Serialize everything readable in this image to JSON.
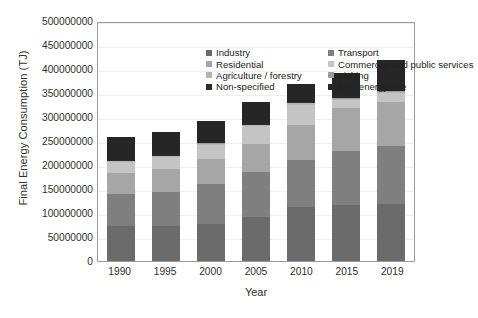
{
  "chart_data": {
    "type": "bar",
    "stacked": true,
    "title": "",
    "xlabel": "Year",
    "ylabel": "Final Energy Consumption (TJ)",
    "categories": [
      "1990",
      "1995",
      "2000",
      "2005",
      "2010",
      "2015",
      "2019"
    ],
    "ylim": [
      0,
      500000000
    ],
    "ytick_values": [
      0,
      50000000,
      100000000,
      150000000,
      200000000,
      250000000,
      300000000,
      350000000,
      400000000,
      450000000,
      500000000
    ],
    "ytick_labels": [
      "0",
      "50000000",
      "100000000",
      "150000000",
      "200000000",
      "250000000",
      "300000000",
      "350000000",
      "400000000",
      "450000000",
      "500000000"
    ],
    "grid": true,
    "legend_position": "upper-left-inside",
    "legend_columns": 2,
    "series": [
      {
        "name": "Industry",
        "color": "#6b6b6b",
        "values": [
          72000000,
          73000000,
          78000000,
          92000000,
          112000000,
          116000000,
          118000000
        ]
      },
      {
        "name": "Transport",
        "color": "#7f7f7f",
        "values": [
          67000000,
          71000000,
          82000000,
          93000000,
          99000000,
          114000000,
          122000000
        ]
      },
      {
        "name": "Residential",
        "color": "#a6a6a6",
        "values": [
          45000000,
          48000000,
          52000000,
          58000000,
          72000000,
          88000000,
          92000000
        ]
      },
      {
        "name": "Commercial and public services",
        "color": "#c4c4c4",
        "values": [
          22000000,
          24000000,
          30000000,
          38000000,
          43000000,
          17000000,
          18000000
        ]
      },
      {
        "name": "Agriculture / forestry",
        "color": "#b4b4b4",
        "values": [
          2000000,
          2000000,
          2000000,
          2500000,
          3000000,
          3000000,
          3000000
        ]
      },
      {
        "name": "Fishing",
        "color": "#9c9c9c",
        "values": [
          1000000,
          1000000,
          1000000,
          1000000,
          1000000,
          1000000,
          1000000
        ]
      },
      {
        "name": "Non-specified",
        "color": "#2b2b2b",
        "values": [
          1000000,
          1000000,
          1000000,
          1000000,
          1000000,
          1000000,
          1000000
        ]
      },
      {
        "name": "Non-energy use",
        "color": "#262626",
        "values": [
          48000000,
          49000000,
          45000000,
          46000000,
          37000000,
          52000000,
          63000000
        ]
      }
    ],
    "totals": [
      258000000,
      269000000,
      291000000,
      331500000,
      368000000,
      392000000,
      418000000
    ]
  },
  "axes": {
    "ylabel": "Final Energy Consumption (TJ)",
    "xlabel": "Year"
  },
  "legend": {
    "items": [
      {
        "label": "Industry",
        "color": "#6b6b6b"
      },
      {
        "label": "Transport",
        "color": "#7f7f7f"
      },
      {
        "label": "Residential",
        "color": "#a6a6a6"
      },
      {
        "label": "Commercial and public services",
        "color": "#c4c4c4"
      },
      {
        "label": "Agriculture / forestry",
        "color": "#b4b4b4"
      },
      {
        "label": "Fishing",
        "color": "#9c9c9c"
      },
      {
        "label": "Non-specified",
        "color": "#2b2b2b"
      },
      {
        "label": "Non-energy use",
        "color": "#262626"
      }
    ]
  },
  "caption": {
    "text": ""
  }
}
